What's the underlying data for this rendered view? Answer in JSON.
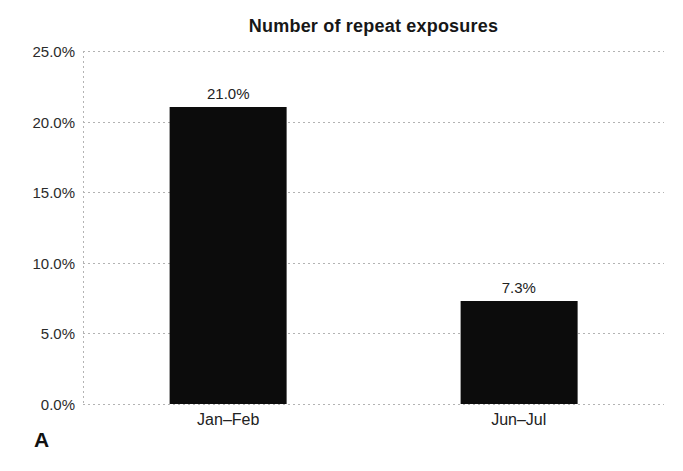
{
  "figure": {
    "panel_label": "A"
  },
  "chart_data": {
    "type": "bar",
    "title": "Number of repeat exposures",
    "categories": [
      "Jan–Feb",
      "Jun–Jul"
    ],
    "values": [
      21.0,
      7.3
    ],
    "value_labels": [
      "21.0%",
      "7.3%"
    ],
    "xlabel": "",
    "ylabel": "",
    "ylim": [
      0,
      25
    ],
    "ytick_step": 5,
    "yticks": [
      "0.0%",
      "5.0%",
      "10.0%",
      "15.0%",
      "20.0%",
      "25.0%"
    ],
    "grid": "horizontal-dotted",
    "legend": "none",
    "bar_color": "#0c0c0c",
    "gridline_color": "#b3b3b3",
    "title_color": "#171717",
    "text_color": "#222222",
    "background": "#ffffff"
  }
}
